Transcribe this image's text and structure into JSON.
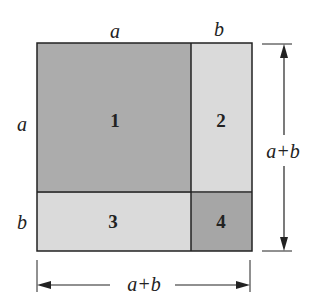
{
  "diagram": {
    "title": "",
    "regions": [
      {
        "id": "1",
        "label": "1",
        "color": "#acacac"
      },
      {
        "id": "2",
        "label": "2",
        "color": "#dadada"
      },
      {
        "id": "3",
        "label": "3",
        "color": "#dadada"
      },
      {
        "id": "4",
        "label": "4",
        "color": "#a6a6a6"
      }
    ],
    "labels": {
      "top_a": "a",
      "top_b": "b",
      "left_a": "a",
      "left_b": "b",
      "right_total": "a+b",
      "bottom_total": "a+b"
    }
  }
}
